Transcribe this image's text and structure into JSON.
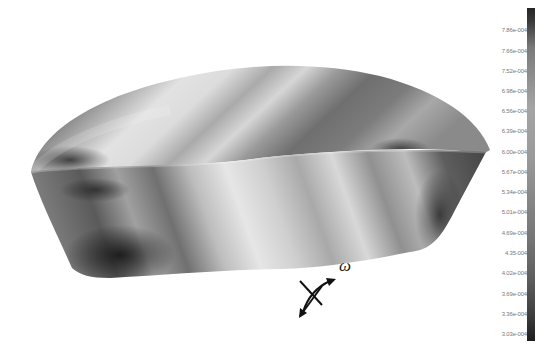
{
  "figure": {
    "axis_label": "ω",
    "colormap": "grayscale"
  },
  "colorbar": {
    "ticks": [
      {
        "label": "7.86e-004",
        "y": 31
      },
      {
        "label": "7.66e-004",
        "y": 52
      },
      {
        "label": "7.52e-004",
        "y": 72
      },
      {
        "label": "6.98e-004",
        "y": 92
      },
      {
        "label": "6.56e-004",
        "y": 112
      },
      {
        "label": "6.39e-004",
        "y": 132
      },
      {
        "label": "6.00e-004",
        "y": 153
      },
      {
        "label": "5.67e-004",
        "y": 173
      },
      {
        "label": "5.34e-004",
        "y": 193
      },
      {
        "label": "5.01e-004",
        "y": 213
      },
      {
        "label": "4.69e-004",
        "y": 234
      },
      {
        "label": "4.35-004",
        "y": 254
      },
      {
        "label": "4.02e-004",
        "y": 274
      },
      {
        "label": "3.69e-004",
        "y": 295
      },
      {
        "label": "3.36e-004",
        "y": 315
      },
      {
        "label": "3.03e-004",
        "y": 335
      }
    ],
    "max": "7.86e-004",
    "min": "3.03e-004"
  }
}
